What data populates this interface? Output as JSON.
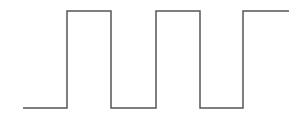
{
  "diagram": {
    "type": "square-wave",
    "stroke_color": "#555555",
    "stroke_width": 1.5,
    "low_y": 108,
    "high_y": 11,
    "points": [
      [
        23,
        108
      ],
      [
        67,
        108
      ],
      [
        67,
        11
      ],
      [
        111,
        11
      ],
      [
        111,
        108
      ],
      [
        156,
        108
      ],
      [
        156,
        11
      ],
      [
        200,
        11
      ],
      [
        200,
        108
      ],
      [
        243,
        108
      ],
      [
        243,
        11
      ],
      [
        289,
        11
      ]
    ]
  }
}
